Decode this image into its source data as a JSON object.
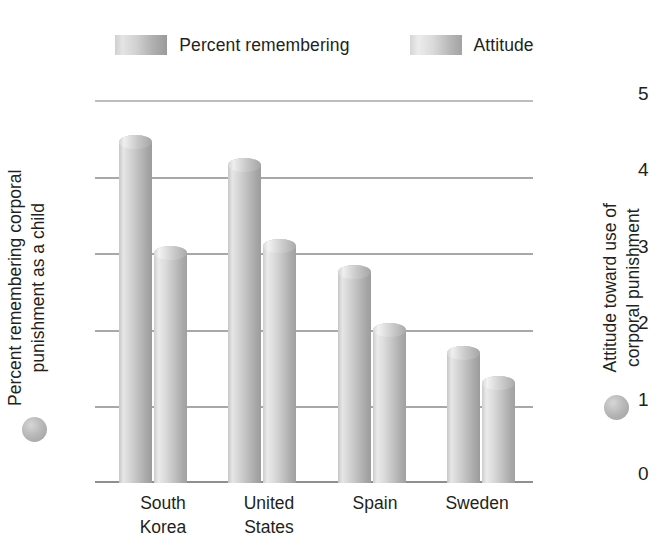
{
  "legend": {
    "entries": [
      {
        "label": "Percent remembering",
        "swatch": "series-a-swatch"
      },
      {
        "label": "Attitude",
        "swatch": "series-b-swatch"
      }
    ]
  },
  "axes": {
    "left": {
      "title": "Percent remembering corporal punishment as a child",
      "ticks": [
        "100",
        "80",
        "60",
        "40",
        "20",
        "0"
      ],
      "marker": "gray-circle"
    },
    "right": {
      "title": "Attitude toward use of corporal punishment",
      "ticks": [
        "5",
        "4",
        "3",
        "2",
        "1",
        "0"
      ],
      "marker": "gray-circle"
    }
  },
  "categories": [
    "South Korea",
    "United States",
    "Spain",
    "Sweden"
  ],
  "chart_data": {
    "type": "bar",
    "title": "",
    "subtitle": "",
    "categories": [
      "South Korea",
      "United States",
      "Spain",
      "Sweden"
    ],
    "series": [
      {
        "name": "Percent remembering",
        "axis": "left",
        "values": [
          89,
          83,
          55,
          34
        ]
      },
      {
        "name": "Attitude",
        "axis": "right",
        "values": [
          3.0,
          3.1,
          2.0,
          1.3
        ]
      }
    ],
    "xlabel": "",
    "ylabel": "Percent remembering corporal punishment as a child",
    "y2label": "Attitude toward use of corporal punishment",
    "ylim": [
      0,
      100
    ],
    "y2lim": [
      0,
      5
    ],
    "yticks": [
      0,
      20,
      40,
      60,
      80,
      100
    ],
    "y2ticks": [
      0,
      1,
      2,
      3,
      4,
      5
    ],
    "grid": true,
    "legend_position": "top",
    "style": "3d-cylinder-grayscale"
  },
  "colors": {
    "gridline": "#a8a8a8",
    "baseline": "#8f8f8f",
    "text": "#231f20",
    "bar_light": "#e6e6e6",
    "bar_dark": "#9c9c9c"
  }
}
